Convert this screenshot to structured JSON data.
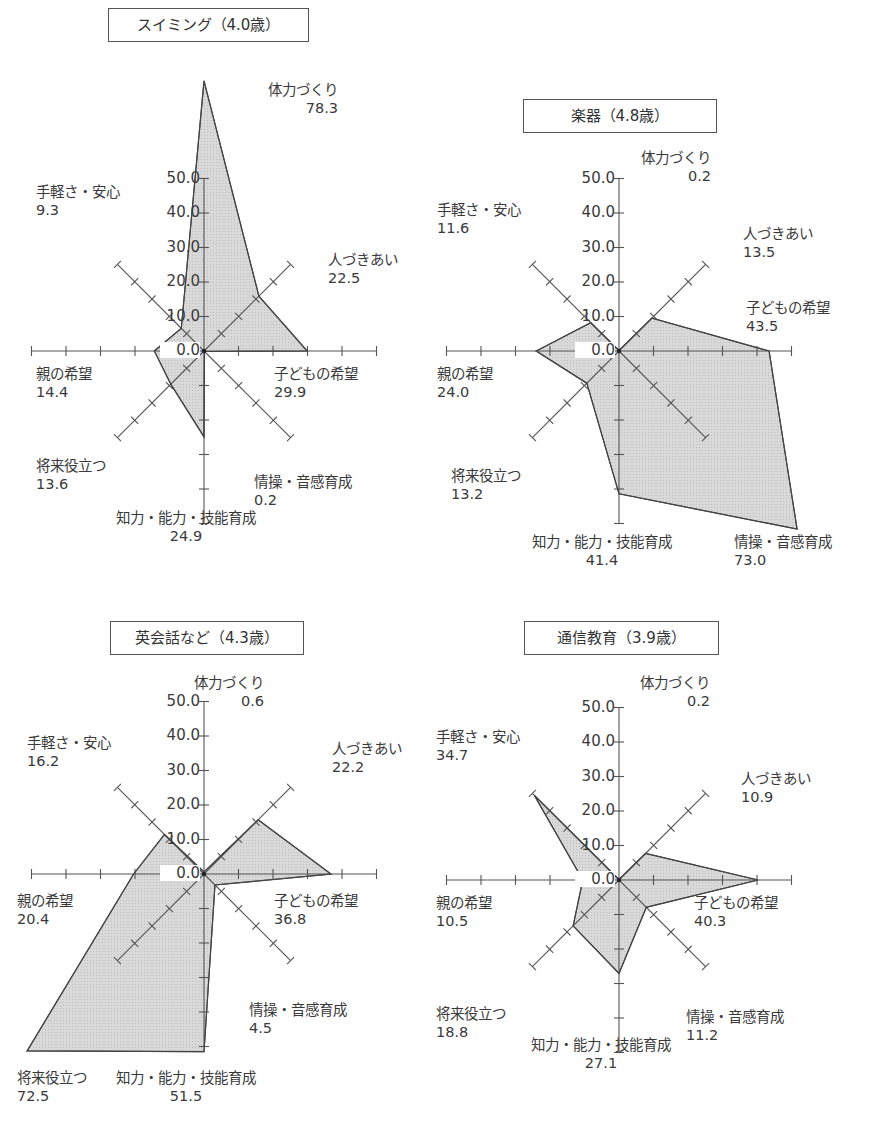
{
  "chart_data": [
    {
      "type": "radar",
      "title": "スイミング（4.0歳）",
      "axes": [
        "体力づくり",
        "人づきあい",
        "子どもの希望",
        "情操・音感育成",
        "知力・能力・技能育成",
        "将来役立つ",
        "親の希望",
        "手軽さ・安心"
      ],
      "values": [
        78.3,
        22.5,
        29.9,
        0.2,
        24.9,
        13.6,
        14.4,
        9.3
      ],
      "value_labels": [
        "78.3",
        "22.5",
        "29.9",
        "0.2",
        "24.9",
        "13.6",
        "14.4",
        "9.3"
      ],
      "radial_ticks": [
        "0.0",
        "10.0",
        "20.0",
        "30.0",
        "40.0",
        "50.0"
      ],
      "rlim": [
        0,
        50
      ]
    },
    {
      "type": "radar",
      "title": "楽器（4.8歳）",
      "axes": [
        "体力づくり",
        "人づきあい",
        "子どもの希望",
        "情操・音感育成",
        "知力・能力・技能育成",
        "将来役立つ",
        "親の希望",
        "手軽さ・安心"
      ],
      "values": [
        0.2,
        13.5,
        43.5,
        73.0,
        41.4,
        13.2,
        24.0,
        11.6
      ],
      "value_labels": [
        "0.2",
        "13.5",
        "43.5",
        "73.0",
        "41.4",
        "13.2",
        "24.0",
        "11.6"
      ],
      "radial_ticks": [
        "0.0",
        "10.0",
        "20.0",
        "30.0",
        "40.0",
        "50.0"
      ],
      "rlim": [
        0,
        50
      ]
    },
    {
      "type": "radar",
      "title": "英会話など（4.3歳）",
      "axes": [
        "体力づくり",
        "人づきあい",
        "子どもの希望",
        "情操・音感育成",
        "知力・能力・技能育成",
        "将来役立つ",
        "親の希望",
        "手軽さ・安心"
      ],
      "values": [
        0.6,
        22.2,
        36.8,
        4.5,
        51.5,
        72.5,
        20.4,
        16.2
      ],
      "value_labels": [
        "0.6",
        "22.2",
        "36.8",
        "4.5",
        "51.5",
        "72.5",
        "20.4",
        "16.2"
      ],
      "radial_ticks": [
        "0.0",
        "10.0",
        "20.0",
        "30.0",
        "40.0",
        "50.0"
      ],
      "rlim": [
        0,
        50
      ]
    },
    {
      "type": "radar",
      "title": "通信教育（3.9歳）",
      "axes": [
        "体力づくり",
        "人づきあい",
        "子どもの希望",
        "情操・音感育成",
        "知力・能力・技能育成",
        "将来役立つ",
        "親の希望",
        "手軽さ・安心"
      ],
      "values": [
        0.2,
        10.9,
        40.3,
        11.2,
        27.1,
        18.8,
        10.5,
        34.7
      ],
      "value_labels": [
        "0.2",
        "10.9",
        "40.3",
        "11.2",
        "27.1",
        "18.8",
        "10.5",
        "34.7"
      ],
      "radial_ticks": [
        "0.0",
        "10.0",
        "20.0",
        "30.0",
        "40.0",
        "50.0"
      ],
      "rlim": [
        0,
        50
      ]
    }
  ],
  "panels": [
    {
      "title": "スイミング（4.0歳）"
    },
    {
      "title": "楽器（4.8歳）"
    },
    {
      "title": "英会話など（4.3歳）"
    },
    {
      "title": "通信教育（3.9歳）"
    }
  ],
  "style": {
    "fill": "#d9d9d9",
    "stroke": "#444444",
    "axis": "#555555"
  }
}
